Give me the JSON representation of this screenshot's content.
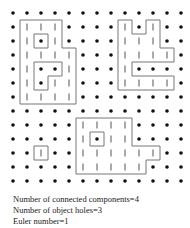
{
  "grid": {
    "origin_x": 13,
    "origin_y": 13,
    "spacing": 14,
    "cols": 13,
    "rows": 13,
    "dot_color": "#111111",
    "bar_color": "#555555",
    "outline_color": "#777777",
    "cells_legend": {
      ".": "background-dot",
      "|": "object-pixel",
      "o": "hole-dot"
    },
    "map": [
      ".............",
      ".|||....|.|..",
      ".|o|....|||..",
      ".||||...||||.",
      ".|oo|...|....",
      ".|o||...||||.",
      ".||||........",
      ".............",
      ".....||||....",
      ".....|o||....",
      "..|..||||||..",
      ".....|||||...",
      "............."
    ]
  },
  "captions": {
    "components": "Number of connected components=4",
    "holes": "Number of object holes=3",
    "euler": "Euler number=1"
  }
}
